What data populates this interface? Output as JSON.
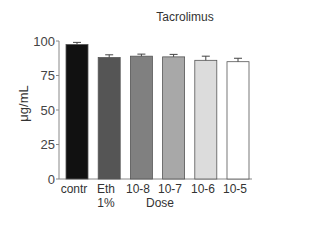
{
  "chart_data": {
    "type": "bar",
    "title": "Tacrolimus",
    "xlabel": "Dose",
    "ylabel": "μg/mL",
    "ylim": [
      0,
      100
    ],
    "yticks": [
      0,
      25,
      50,
      75,
      100
    ],
    "categories": [
      "contr",
      "Eth 1%",
      "10-8",
      "10-7",
      "10-6",
      "10-5"
    ],
    "values": [
      97.5,
      88,
      89,
      88.5,
      86,
      85
    ],
    "errors": [
      1.5,
      2,
      1.5,
      1.8,
      3,
      2.5
    ],
    "bar_colors": [
      "#111111",
      "#555555",
      "#808080",
      "#a8a8a8",
      "#dcdcdc",
      "#ffffff"
    ],
    "grid": false,
    "legend": null
  },
  "labels": {
    "title": "Tacrolimus",
    "xlabel": "Dose",
    "ylabel": "μg/mL",
    "yticks": [
      "100",
      "75",
      "50",
      "25",
      "0"
    ],
    "xticks": [
      "contr",
      "Eth 1%",
      "10-8",
      "10-7",
      "10-6",
      "10-5"
    ]
  }
}
